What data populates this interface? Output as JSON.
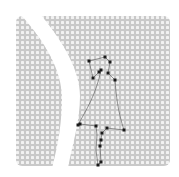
{
  "image": {
    "width": 179,
    "height": 177,
    "background_color": "#ffffff",
    "pattern_color": "#c9c9c9",
    "pattern_dot_color": "#ffffff",
    "square": {
      "x": 16,
      "y": 16,
      "width": 154,
      "height": 150,
      "corner_radius": 6
    },
    "white_band_path": "M20,14 L40,14 C62,40 80,70 80,96 C80,122 72,146 68,168 L52,168 C58,146 62,122 62,98 C62,70 44,40 20,14 Z",
    "left_cutout_path": "M14,14 L20,14 C44,40 60,70 58,98 C56,130 44,152 30,168 L14,168 Z",
    "outline_color": "#555555",
    "point_color": "#1a1a1a",
    "outline_points": [
      [
        89,
        61
      ],
      [
        105,
        57
      ],
      [
        110,
        62
      ],
      [
        101,
        70
      ],
      [
        99,
        72
      ],
      [
        108,
        73
      ],
      [
        93,
        78
      ],
      [
        115,
        80
      ],
      [
        124,
        130
      ],
      [
        107,
        128
      ],
      [
        102,
        133
      ],
      [
        101,
        140
      ],
      [
        100,
        146
      ],
      [
        101,
        162
      ],
      [
        98,
        165
      ],
      [
        96,
        126
      ],
      [
        80,
        124
      ],
      [
        78,
        125
      ]
    ],
    "outline_path": "M89,61 L105,57 L110,62 L108,73 L115,80 C116,95 118,112 124,130 L107,128 L102,133 L101,140 L100,146 L101,162 L98,165 L96,150 L97,135 L96,126 L80,124 L78,125 C86,110 96,95 101,70 L99,72 L93,78 L89,61 Z"
  }
}
